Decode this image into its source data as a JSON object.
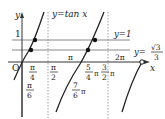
{
  "diagram": {
    "function_label": "y=tan x",
    "axis": {
      "x_label": "x",
      "y_label": "y",
      "origin_label": "O"
    },
    "horizontal_lines": [
      {
        "label": "y=1",
        "y_tick": "1"
      },
      {
        "label": "y=",
        "value_num": "√3",
        "value_den": "3"
      }
    ],
    "x_ticks": [
      {
        "id": "pi6",
        "num": "π",
        "den": "6"
      },
      {
        "id": "pi4",
        "num": "π",
        "den": "4"
      },
      {
        "id": "pi2",
        "num": "π",
        "den": "2"
      },
      {
        "id": "pi",
        "text": "π"
      },
      {
        "id": "7pi6",
        "num": "7",
        "den": "6",
        "suffix": "π"
      },
      {
        "id": "5pi4",
        "num": "5",
        "den": "4",
        "suffix": "π"
      },
      {
        "id": "3pi2",
        "num": "3",
        "den": "2",
        "suffix": "π"
      },
      {
        "id": "2pi",
        "text": "2π"
      }
    ]
  }
}
